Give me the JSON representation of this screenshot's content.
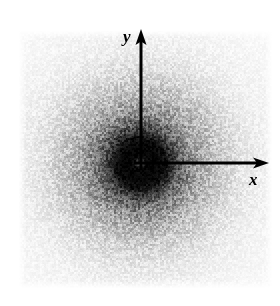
{
  "figure": {
    "caption": "",
    "background_color": "#ffffff",
    "ink_color": "#000000",
    "width": 280,
    "height": 306
  },
  "axes": {
    "origin": {
      "x": 141,
      "y": 163
    },
    "x_axis": {
      "label": "x",
      "name": "x-axis-arrow",
      "direction": "right",
      "start_x": 141,
      "end_x": 268,
      "y": 163,
      "shaft_width": 3,
      "head_length": 14,
      "head_width": 12,
      "label_x": 249,
      "label_y": 171
    },
    "y_axis": {
      "label": "y",
      "name": "y-axis-arrow",
      "direction": "up",
      "start_y": 163,
      "end_y": 30,
      "x": 141,
      "shaft_width": 3,
      "head_length": 14,
      "head_width": 12,
      "label_x": 123,
      "label_y": 28
    }
  },
  "chart_data": {
    "type": "heatmap",
    "title": "",
    "subtitle": "",
    "xlabel": "x",
    "ylabel": "y",
    "colormap": "grayscale-inverted",
    "value_meaning": "intensity (darker = higher counts)",
    "grid": false,
    "legend": false,
    "field_bounds_px": {
      "left": 18,
      "top": 30,
      "right": 272,
      "bottom": 288
    },
    "center_px": {
      "x": 140,
      "y": 163
    },
    "peak": {
      "label": "central maximum",
      "center_x_px": 140,
      "center_y_px": 163,
      "saturated_core_radius_px": 26,
      "halo_radius_px": 90,
      "has_central_bright_pinhole": true,
      "pinhole_radius_px": 6
    },
    "radial_profile": {
      "xlabel": "radius (px from center)",
      "ylabel": "mean darkness (0 = white, 1 = black)",
      "radius_px": [
        0,
        5,
        10,
        15,
        20,
        26,
        32,
        40,
        50,
        60,
        70,
        80,
        90,
        100,
        115,
        130
      ],
      "darkness": [
        0.88,
        0.96,
        0.98,
        0.98,
        0.97,
        0.92,
        0.78,
        0.6,
        0.44,
        0.34,
        0.26,
        0.2,
        0.15,
        0.11,
        0.07,
        0.05
      ]
    },
    "noise": {
      "type": "speckle",
      "grain_size_px": 2,
      "amplitude": 0.45
    }
  }
}
